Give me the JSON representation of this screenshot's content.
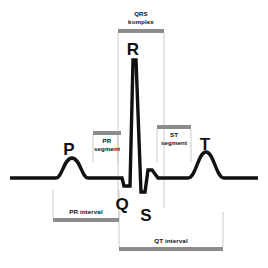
{
  "diagram": {
    "background_color": "#ffffff",
    "trace_color": "#111111",
    "bar_color": "#8c8c8c",
    "guide_color": "#c9c9c9",
    "wave_labels": [
      {
        "name": "p-wave",
        "text": "P",
        "x": 69,
        "y": 141
      },
      {
        "name": "r-wave",
        "text": "R",
        "x": 133,
        "y": 41
      },
      {
        "name": "q-wave",
        "text": "Q",
        "x": 122,
        "y": 196
      },
      {
        "name": "s-wave",
        "text": "S",
        "x": 146,
        "y": 207
      },
      {
        "name": "t-wave",
        "text": "T",
        "x": 205,
        "y": 136
      }
    ],
    "annotations": [
      {
        "name": "qrs-komplex",
        "line1": "QRS",
        "line2": "komplex",
        "bar": {
          "x": 118,
          "y": 29,
          "width": 46,
          "height": 4
        },
        "caption": {
          "x": 141,
          "y": 10
        },
        "guides": [
          {
            "x": 118,
            "y1": 33,
            "y2": 208
          },
          {
            "x": 164,
            "y1": 33,
            "y2": 208
          }
        ]
      },
      {
        "name": "pr-segment",
        "line1": "PR",
        "line2": "segment",
        "bar": {
          "x": 93,
          "y": 131,
          "width": 28,
          "height": 4
        },
        "caption": {
          "x": 107,
          "y": 137
        },
        "guides": [
          {
            "x": 93,
            "y1": 135,
            "y2": 162
          },
          {
            "x": 118,
            "y1": 135,
            "y2": 162
          }
        ]
      },
      {
        "name": "st-segment",
        "line1": "ST",
        "line2": "segment",
        "bar": {
          "x": 157,
          "y": 125,
          "width": 34,
          "height": 4
        },
        "caption": {
          "x": 174,
          "y": 131
        },
        "guides": [
          {
            "x": 157,
            "y1": 129,
            "y2": 162
          },
          {
            "x": 191,
            "y1": 129,
            "y2": 162
          }
        ]
      },
      {
        "name": "pr-interval",
        "line1": "PR interval",
        "line2": "",
        "bar": {
          "x": 53,
          "y": 218,
          "width": 66,
          "height": 4
        },
        "caption": {
          "x": 86,
          "y": 209
        },
        "guides": [
          {
            "x": 53,
            "y1": 190,
            "y2": 218
          },
          {
            "x": 119,
            "y1": 190,
            "y2": 218
          }
        ]
      },
      {
        "name": "qt-interval",
        "line1": "QT interval",
        "line2": "",
        "bar": {
          "x": 119,
          "y": 247,
          "width": 104,
          "height": 4
        },
        "caption": {
          "x": 171,
          "y": 238
        },
        "guides": [
          {
            "x": 119,
            "y1": 212,
            "y2": 247
          },
          {
            "x": 223,
            "y1": 212,
            "y2": 247
          }
        ]
      }
    ],
    "trace_path": "M 10 178 L 56 178 C 62 178 64 158 72 158 C 80 158 82 178 88 178 L 122 178 L 124 186 L 130 186 L 133 60 L 136 60 L 141 192 L 145 192 L 148 170 L 152 170 L 158 178 L 188 178 C 196 178 198 152 206 152 C 214 152 216 178 224 178 L 258 178",
    "trace_width": 3.4
  }
}
